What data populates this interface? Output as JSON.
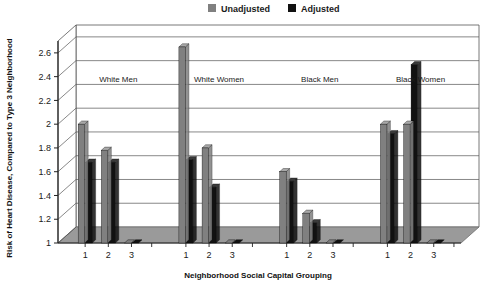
{
  "chart_data": {
    "type": "bar",
    "title": "",
    "xlabel": "Neighborhood Social Capital Grouping",
    "ylabel": "Risk of Heart Disease, Compared to Type 3 Neighborhood",
    "ylim": [
      1,
      2.7
    ],
    "yticks": [
      "1",
      "1.2",
      "1.4",
      "1.6",
      "1.8",
      "2",
      "2.2",
      "2.4",
      "2.6"
    ],
    "ytick_values": [
      1,
      1.2,
      1.4,
      1.6,
      1.8,
      2,
      2.2,
      2.4,
      2.6
    ],
    "grid": true,
    "style": "3d-column",
    "legend_position": "top-center",
    "categories": [
      "1",
      "2",
      "3"
    ],
    "groups": [
      "White Men",
      "White Women",
      "Black Men",
      "Black Women"
    ],
    "series": [
      {
        "name": "Unadjusted",
        "color": "#808080",
        "values_by_group": {
          "White Men": [
            2.0,
            1.78,
            1.0
          ],
          "White Women": [
            2.65,
            1.8,
            1.0
          ],
          "Black Men": [
            1.6,
            1.25,
            1.0
          ],
          "Black Women": [
            2.0,
            2.0,
            1.0
          ]
        }
      },
      {
        "name": "Adjusted",
        "color": "#111111",
        "values_by_group": {
          "White Men": [
            1.68,
            1.68,
            1.0
          ],
          "White Women": [
            1.7,
            1.47,
            1.0
          ],
          "Black Men": [
            1.52,
            1.17,
            1.0
          ],
          "Black Women": [
            1.92,
            2.5,
            1.0
          ]
        }
      }
    ]
  },
  "legend": {
    "items": [
      {
        "label": "Unadjusted",
        "swatch_color": "#808080"
      },
      {
        "label": "Adjusted",
        "swatch_color": "#111111"
      }
    ]
  },
  "colors": {
    "unadjusted": "#808080",
    "unadjusted_top": "#a9a9a9",
    "adjusted": "#111111",
    "adjusted_top": "#3a3a3a",
    "floor": "#9a9a9a",
    "floor_front": "#8c8c8c",
    "gridline": "#555555",
    "axis": "#222222",
    "background": "#ffffff"
  }
}
